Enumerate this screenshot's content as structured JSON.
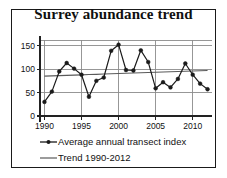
{
  "chart_data": {
    "type": "line",
    "title": "Surrey abundance trend",
    "xlabel": "",
    "ylabel": "",
    "xlim": [
      1989.4,
      2012.6
    ],
    "ylim": [
      0,
      162
    ],
    "grid": true,
    "xticks": [
      1990,
      1995,
      2000,
      2005,
      2010
    ],
    "xtick_labels": [
      "1990",
      "1995",
      "2000",
      "2005",
      "2010"
    ],
    "yticks": [
      0,
      50,
      100,
      150
    ],
    "ytick_labels": [
      "0",
      "50",
      "100",
      "150"
    ],
    "x": [
      1990,
      1991,
      1992,
      1993,
      1994,
      1995,
      1996,
      1997,
      1998,
      1999,
      2000,
      2001,
      2002,
      2003,
      2004,
      2005,
      2006,
      2007,
      2008,
      2009,
      2010,
      2011,
      2012
    ],
    "series": [
      {
        "name": "Average annual transect index",
        "type": "line-marker",
        "color": "#1a1a1a",
        "marker": "circle",
        "values": [
          30,
          52,
          95,
          113,
          101,
          88,
          41,
          75,
          82,
          139,
          152,
          98,
          97,
          140,
          115,
          59,
          72,
          61,
          79,
          112,
          88,
          69,
          57
        ]
      },
      {
        "name": "Trend 1990-2012",
        "type": "line",
        "color": "#5a5a5a",
        "marker": "none",
        "values": [
          85,
          85.5,
          86.1,
          86.6,
          87.2,
          87.7,
          88.3,
          88.8,
          89.4,
          89.9,
          90.5,
          91,
          91.6,
          92.1,
          92.7,
          93.2,
          93.8,
          94.3,
          94.9,
          95.4,
          96,
          96.5,
          97
        ]
      }
    ],
    "legend": {
      "position": "bottom",
      "entries": [
        {
          "label": "Average annual transect index",
          "style": "line-marker",
          "color": "#1a1a1a"
        },
        {
          "label": "Trend 1990-2012",
          "style": "line",
          "color": "#5a5a5a"
        }
      ]
    },
    "colors": {
      "series_line": "#1a1a1a",
      "trend_line": "#5a5a5a",
      "grid": "#8c8c8c",
      "axis": "#222222",
      "frame": "#1a1a1a",
      "background": "#ffffff",
      "text": "#111111"
    }
  }
}
